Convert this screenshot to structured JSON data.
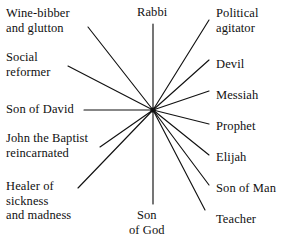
{
  "diagram": {
    "type": "radial-spoke",
    "title": "",
    "hub": {
      "x": 153,
      "y": 110
    },
    "style": {
      "line_color": "#111111",
      "text_color": "#101010",
      "background_color": "#ffffff"
    },
    "labels": [
      {
        "id": "wine-bibber-and-glutton",
        "text": "Wine-bibber\nand glutton",
        "side": "left",
        "x": 6,
        "y": 6,
        "spoke": {
          "x1": 88,
          "y1": 27,
          "x2": 153,
          "y2": 110
        }
      },
      {
        "id": "social-reformer",
        "text": "Social\nreformer",
        "side": "left",
        "x": 6,
        "y": 50,
        "spoke": {
          "x1": 68,
          "y1": 66,
          "x2": 153,
          "y2": 110
        }
      },
      {
        "id": "son-of-david",
        "text": "Son of David",
        "side": "left",
        "x": 6,
        "y": 102,
        "spoke": {
          "x1": 84,
          "y1": 110,
          "x2": 153,
          "y2": 110
        }
      },
      {
        "id": "john-the-baptist-reincarnated",
        "text": "John the Baptist\nreincarnated",
        "side": "left",
        "x": 6,
        "y": 131,
        "spoke": {
          "x1": 100,
          "y1": 147,
          "x2": 153,
          "y2": 110
        }
      },
      {
        "id": "healer-of-sickness-and-madness",
        "text": "Healer of\nsickness\nand madness",
        "side": "left",
        "x": 6,
        "y": 179,
        "spoke": {
          "x1": 78,
          "y1": 188,
          "x2": 153,
          "y2": 110
        }
      },
      {
        "id": "rabbi",
        "text": "Rabbi",
        "side": "top",
        "x": 137,
        "y": 5,
        "spoke": {
          "x1": 153,
          "y1": 24,
          "x2": 153,
          "y2": 110
        }
      },
      {
        "id": "son-of-god",
        "text": "Son\nof God",
        "side": "bottom",
        "x": 129,
        "y": 208,
        "spoke": {
          "x1": 153,
          "y1": 204,
          "x2": 153,
          "y2": 110
        }
      },
      {
        "id": "political-agitator",
        "text": "Political\nagitator",
        "side": "right",
        "x": 216,
        "y": 6,
        "spoke": {
          "x1": 209,
          "y1": 20,
          "x2": 153,
          "y2": 110
        }
      },
      {
        "id": "devil",
        "text": "Devil",
        "side": "right",
        "x": 216,
        "y": 57,
        "spoke": {
          "x1": 209,
          "y1": 60,
          "x2": 153,
          "y2": 110
        }
      },
      {
        "id": "messiah",
        "text": "Messiah",
        "side": "right",
        "x": 216,
        "y": 88,
        "spoke": {
          "x1": 209,
          "y1": 91,
          "x2": 153,
          "y2": 110
        }
      },
      {
        "id": "prophet",
        "text": "Prophet",
        "side": "right",
        "x": 216,
        "y": 119,
        "spoke": {
          "x1": 209,
          "y1": 124,
          "x2": 153,
          "y2": 110
        }
      },
      {
        "id": "elijah",
        "text": "Elijah",
        "side": "right",
        "x": 216,
        "y": 150,
        "spoke": {
          "x1": 209,
          "y1": 155,
          "x2": 153,
          "y2": 110
        }
      },
      {
        "id": "son-of-man",
        "text": "Son of Man",
        "side": "right",
        "x": 216,
        "y": 181,
        "spoke": {
          "x1": 209,
          "y1": 185,
          "x2": 153,
          "y2": 110
        }
      },
      {
        "id": "teacher",
        "text": "Teacher",
        "side": "right",
        "x": 216,
        "y": 212,
        "spoke": {
          "x1": 205,
          "y1": 210,
          "x2": 153,
          "y2": 110
        }
      }
    ]
  }
}
